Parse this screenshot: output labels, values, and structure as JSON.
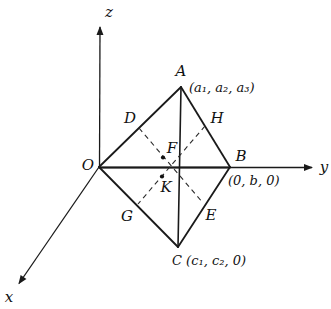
{
  "figure": {
    "colors": {
      "ink": "#1a1a1a",
      "background": "#ffffff"
    },
    "axis_labels": {
      "x": "x",
      "y": "y",
      "z": "z"
    },
    "vertex_labels": {
      "origin": "O",
      "a": "A",
      "a_coords": "(a₁, a₂, a₃)",
      "b": "B",
      "b_coords": "(0, b, 0)",
      "c_with_coords": "C (c₁, c₂, 0)"
    },
    "midpoint_labels": {
      "d": "D",
      "h": "H",
      "g": "G",
      "e": "E",
      "f": "F",
      "k": "K"
    }
  }
}
